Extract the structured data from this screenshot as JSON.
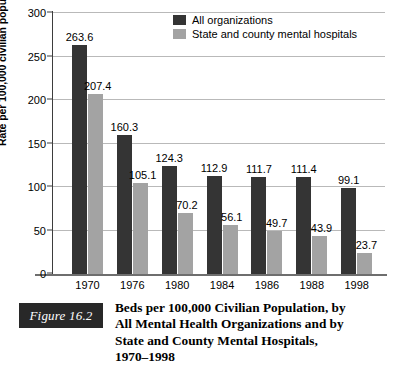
{
  "chart_data": {
    "type": "bar",
    "xlabel": "",
    "ylabel": "Rate per 100,000 civilian population",
    "ylim": [
      0,
      300
    ],
    "yticks": [
      0,
      50,
      100,
      150,
      200,
      250,
      300
    ],
    "ytick_labels": [
      "0",
      "50",
      "100",
      "150",
      "200",
      "250",
      "300"
    ],
    "grid": true,
    "legend_position": "top-center",
    "categories": [
      "1970",
      "1976",
      "1980",
      "1984",
      "1986",
      "1988",
      "1998"
    ],
    "series": [
      {
        "name": "All organizations",
        "color": "#343434",
        "values": [
          263.6,
          160.3,
          124.3,
          112.9,
          111.7,
          111.4,
          99.1
        ],
        "value_labels": [
          "263.6",
          "160.3",
          "124.3",
          "112.9",
          "111.7",
          "111.4",
          "99.1"
        ]
      },
      {
        "name": "State and county mental hospitals",
        "color": "#a3a3a3",
        "values": [
          207.4,
          105.1,
          70.2,
          56.1,
          49.7,
          43.9,
          23.7
        ],
        "value_labels": [
          "207.4",
          "105.1",
          "70.2",
          "56.1",
          "49.7",
          "43.9",
          "23.7"
        ]
      }
    ]
  },
  "figure": {
    "badge_label": "Figure 16.2",
    "caption_lines": [
      "Beds per 100,000 Civilian Population, by",
      "All Mental Health Organizations and by",
      "State and County Mental Hospitals,",
      "1970–1998"
    ]
  }
}
